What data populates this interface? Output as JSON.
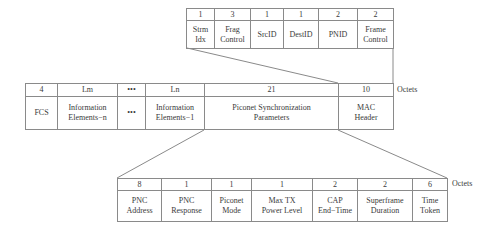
{
  "top_table": {
    "sizes": [
      "1",
      "3",
      "1",
      "1",
      "2",
      "2"
    ],
    "names": [
      "Strm\nIdx",
      "Frag\nControl",
      "SrcID",
      "DestID",
      "PNID",
      "Frame\nControl"
    ]
  },
  "middle_table": {
    "sizes": [
      "4",
      "Lm",
      "•••",
      "Ln",
      "21",
      "10"
    ],
    "names": [
      "FCS",
      "Information\nElements−n",
      "•••",
      "Information\nElements−1",
      "Piconet Synchronization\nParameters",
      "MAC\nHeader"
    ],
    "units_label": "Octets"
  },
  "bottom_table": {
    "sizes": [
      "8",
      "1",
      "1",
      "1",
      "2",
      "2",
      "6"
    ],
    "names": [
      "PNC\nAddress",
      "PNC\nResponse",
      "Piconet\nMode",
      "Max TX\nPower Level",
      "CAP\nEnd−Time",
      "Superframe\nDuration",
      "Time\nToken"
    ],
    "units_label": "Octets"
  }
}
